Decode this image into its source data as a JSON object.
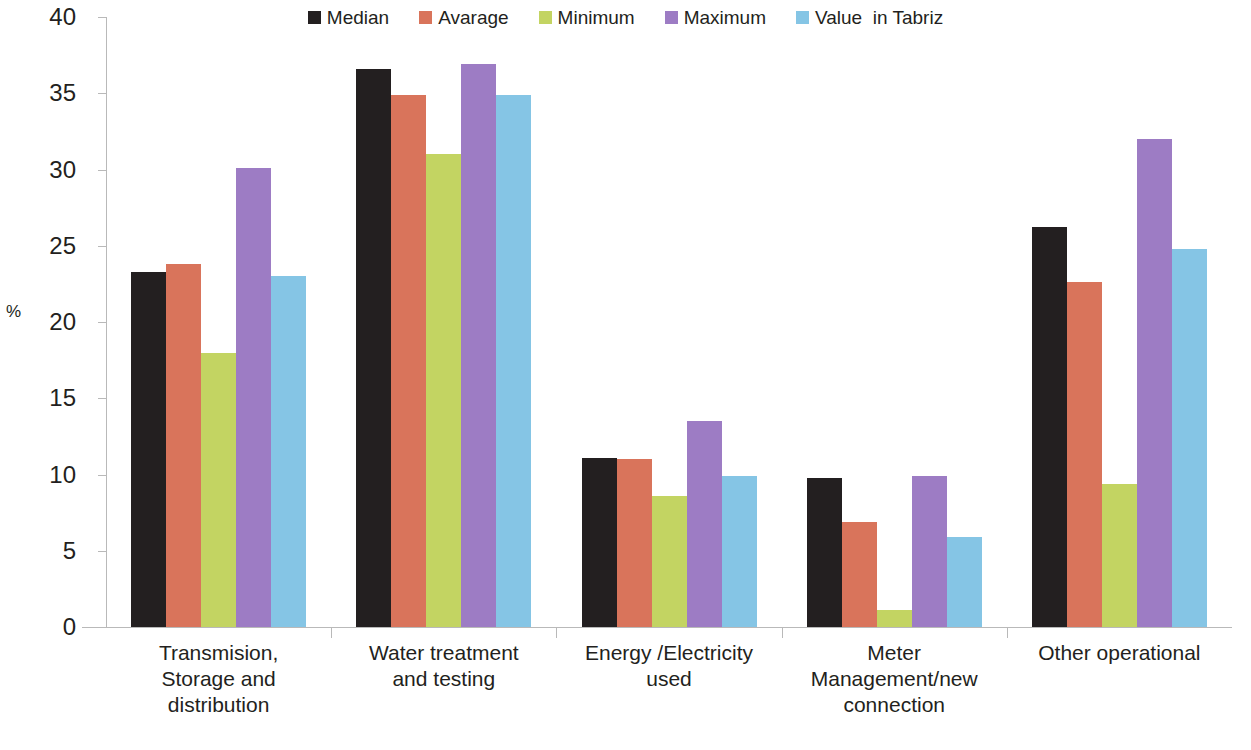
{
  "chart_data": {
    "type": "bar",
    "title": "",
    "subtitle": "",
    "xlabel": "",
    "ylabel": "%",
    "ylim": [
      0,
      40
    ],
    "ytick_step": 5,
    "yticks": [
      40,
      35,
      30,
      25,
      20,
      15,
      10,
      5,
      0
    ],
    "grid": false,
    "legend_position": "top-center",
    "categories": [
      "Transmision, Storage and distribution",
      "Water treatment and testing",
      "Energy /Electricity used",
      "Meter Management/new connection",
      "Other operational"
    ],
    "category_lines": [
      [
        "Transmision,",
        "Storage and",
        "distribution"
      ],
      [
        "Water treatment",
        "and testing"
      ],
      [
        "Energy /Electricity",
        "used"
      ],
      [
        "Meter",
        "Management/new",
        "connection"
      ],
      [
        "Other operational"
      ]
    ],
    "series": [
      {
        "name": "Median",
        "color": "#231f20",
        "values": [
          23.3,
          36.6,
          11.1,
          9.8,
          26.2
        ]
      },
      {
        "name": "Avarage",
        "color": "#d9745b",
        "values": [
          23.8,
          34.9,
          11.0,
          6.9,
          22.6
        ]
      },
      {
        "name": "Minimum",
        "color": "#c3d462",
        "values": [
          18.0,
          31.0,
          8.6,
          1.1,
          9.4
        ]
      },
      {
        "name": "Maximum",
        "color": "#9d7cc4",
        "values": [
          30.1,
          36.9,
          13.5,
          9.9,
          32.0
        ]
      },
      {
        "name": "Value  in Tabriz",
        "color": "#85c5e5",
        "values": [
          23.0,
          34.9,
          9.9,
          5.9,
          24.8
        ]
      }
    ]
  },
  "legend": {
    "items": [
      {
        "label": "Median",
        "color": "#231f20"
      },
      {
        "label": "Avarage",
        "color": "#d9745b"
      },
      {
        "label": "Minimum",
        "color": "#c3d462"
      },
      {
        "label": "Maximum",
        "color": "#9d7cc4"
      },
      {
        "label": "Value  in Tabriz",
        "color": "#85c5e5"
      }
    ]
  },
  "axis": {
    "y_title": "%",
    "y_tick_labels": [
      "40",
      "35",
      "30",
      "25",
      "20",
      "15",
      "10",
      "5",
      "0"
    ]
  },
  "colors": {
    "axis_line": "#b9b9b9",
    "text": "#231f20",
    "background": "#ffffff"
  }
}
